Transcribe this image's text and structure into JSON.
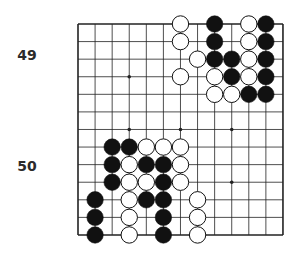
{
  "labels": [
    {
      "text": "49",
      "x": 27,
      "y": 55
    },
    {
      "text": "50",
      "x": 27,
      "y": 166
    }
  ],
  "board": {
    "columns": 13,
    "rows": 13,
    "origin_x": 78,
    "origin_y": 24,
    "step_x": 17.08,
    "step_y": 17.58,
    "line_color": "#222222",
    "stone_black": "#111111",
    "stone_white": "#ffffff",
    "star_points": [
      [
        3,
        3
      ],
      [
        3,
        6
      ],
      [
        6,
        6
      ],
      [
        9,
        6
      ],
      [
        9,
        9
      ]
    ],
    "stones": [
      {
        "c": 6,
        "r": 0,
        "color": "white"
      },
      {
        "c": 8,
        "r": 0,
        "color": "black"
      },
      {
        "c": 10,
        "r": 0,
        "color": "white"
      },
      {
        "c": 11,
        "r": 0,
        "color": "black"
      },
      {
        "c": 6,
        "r": 1,
        "color": "white"
      },
      {
        "c": 8,
        "r": 1,
        "color": "black"
      },
      {
        "c": 10,
        "r": 1,
        "color": "white"
      },
      {
        "c": 11,
        "r": 1,
        "color": "black"
      },
      {
        "c": 7,
        "r": 2,
        "color": "white"
      },
      {
        "c": 8,
        "r": 2,
        "color": "black"
      },
      {
        "c": 9,
        "r": 2,
        "color": "black"
      },
      {
        "c": 10,
        "r": 2,
        "color": "white"
      },
      {
        "c": 11,
        "r": 2,
        "color": "black"
      },
      {
        "c": 6,
        "r": 3,
        "color": "white"
      },
      {
        "c": 8,
        "r": 3,
        "color": "white"
      },
      {
        "c": 9,
        "r": 3,
        "color": "black"
      },
      {
        "c": 10,
        "r": 3,
        "color": "white"
      },
      {
        "c": 11,
        "r": 3,
        "color": "black"
      },
      {
        "c": 8,
        "r": 4,
        "color": "white"
      },
      {
        "c": 9,
        "r": 4,
        "color": "white"
      },
      {
        "c": 10,
        "r": 4,
        "color": "black"
      },
      {
        "c": 11,
        "r": 4,
        "color": "black"
      },
      {
        "c": 2,
        "r": 7,
        "color": "black"
      },
      {
        "c": 3,
        "r": 7,
        "color": "black"
      },
      {
        "c": 4,
        "r": 7,
        "color": "white"
      },
      {
        "c": 5,
        "r": 7,
        "color": "white"
      },
      {
        "c": 6,
        "r": 7,
        "color": "white"
      },
      {
        "c": 2,
        "r": 8,
        "color": "black"
      },
      {
        "c": 3,
        "r": 8,
        "color": "white"
      },
      {
        "c": 4,
        "r": 8,
        "color": "black"
      },
      {
        "c": 5,
        "r": 8,
        "color": "black"
      },
      {
        "c": 6,
        "r": 8,
        "color": "white"
      },
      {
        "c": 2,
        "r": 9,
        "color": "black"
      },
      {
        "c": 3,
        "r": 9,
        "color": "white"
      },
      {
        "c": 4,
        "r": 9,
        "color": "white"
      },
      {
        "c": 5,
        "r": 9,
        "color": "black"
      },
      {
        "c": 6,
        "r": 9,
        "color": "white"
      },
      {
        "c": 1,
        "r": 10,
        "color": "black"
      },
      {
        "c": 3,
        "r": 10,
        "color": "white"
      },
      {
        "c": 4,
        "r": 10,
        "color": "black"
      },
      {
        "c": 5,
        "r": 10,
        "color": "black"
      },
      {
        "c": 7,
        "r": 10,
        "color": "white"
      },
      {
        "c": 1,
        "r": 11,
        "color": "black"
      },
      {
        "c": 3,
        "r": 11,
        "color": "white"
      },
      {
        "c": 5,
        "r": 11,
        "color": "black"
      },
      {
        "c": 7,
        "r": 11,
        "color": "white"
      },
      {
        "c": 1,
        "r": 12,
        "color": "black"
      },
      {
        "c": 3,
        "r": 12,
        "color": "white"
      },
      {
        "c": 5,
        "r": 12,
        "color": "black"
      },
      {
        "c": 7,
        "r": 12,
        "color": "white"
      }
    ]
  }
}
